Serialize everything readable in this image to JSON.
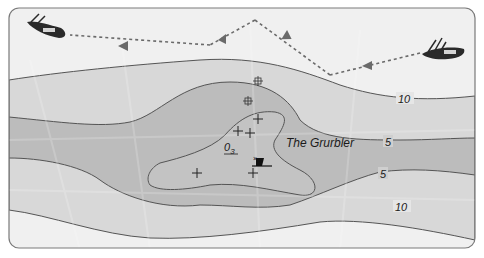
{
  "diagram": {
    "type": "nautical-chart",
    "hazard_name": "The Grurbler",
    "hazard_height_label": "0",
    "hazard_height_subscript": "3",
    "contour_labels": {
      "upper_outer": "10",
      "upper_middle": "5",
      "lower_middle": "5",
      "lower_outer": "10"
    },
    "colors": {
      "frame_border": "#7a7a7a",
      "deep_water": "#efefef",
      "band_10": "#d6d6d6",
      "band_5": "#bdbdbd",
      "shoal": "#c6c6c6",
      "contour_line": "#555555",
      "route": "#6a6a6a",
      "boat_hull": "#2a2a2a"
    },
    "icons": {
      "boat_start": "boat-icon",
      "boat_end": "boat-icon",
      "wreck": "wreck-icon",
      "rocks": "rock-cross-icon",
      "obstruction": "obstruction-icon"
    }
  }
}
